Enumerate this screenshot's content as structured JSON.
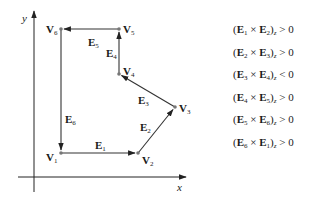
{
  "axes": {
    "x_label": "x",
    "y_label": "y"
  },
  "vertices": [
    {
      "name": "V",
      "index": "1",
      "x": 61,
      "y": 153
    },
    {
      "name": "V",
      "index": "2",
      "x": 138,
      "y": 153
    },
    {
      "name": "V",
      "index": "3",
      "x": 175,
      "y": 107
    },
    {
      "name": "V",
      "index": "4",
      "x": 119,
      "y": 74
    },
    {
      "name": "V",
      "index": "5",
      "x": 119,
      "y": 29
    },
    {
      "name": "V",
      "index": "6",
      "x": 61,
      "y": 29
    }
  ],
  "edges": [
    {
      "name": "E",
      "index": "1",
      "from": "V1",
      "to": "V2"
    },
    {
      "name": "E",
      "index": "2",
      "from": "V2",
      "to": "V3"
    },
    {
      "name": "E",
      "index": "3",
      "from": "V3",
      "to": "V4"
    },
    {
      "name": "E",
      "index": "4",
      "from": "V4",
      "to": "V5"
    },
    {
      "name": "E",
      "index": "5",
      "from": "V5",
      "to": "V6"
    },
    {
      "name": "E",
      "index": "6",
      "from": "V6",
      "to": "V1"
    }
  ],
  "conditions": [
    {
      "a": "1",
      "b": "2",
      "comp": "z",
      "op": "> 0"
    },
    {
      "a": "2",
      "b": "3",
      "comp": "z",
      "op": "> 0"
    },
    {
      "a": "3",
      "b": "4",
      "comp": "z",
      "op": "< 0"
    },
    {
      "a": "4",
      "b": "5",
      "comp": "z",
      "op": "> 0"
    },
    {
      "a": "5",
      "b": "6",
      "comp": "z",
      "op": "> 0"
    },
    {
      "a": "6",
      "b": "1",
      "comp": "z",
      "op": "> 0"
    }
  ],
  "symbols": {
    "vertex": "V",
    "edge": "E",
    "cross": "×",
    "open_paren": "(",
    "close_paren": ")"
  }
}
